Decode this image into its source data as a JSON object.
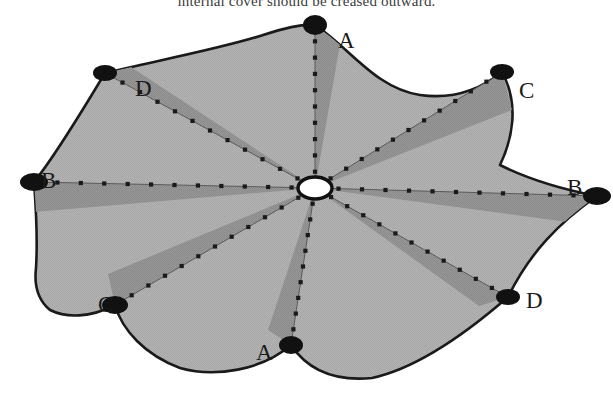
{
  "figure": {
    "title_text": "internal cover should be creased outward.",
    "footer_text": "",
    "type": "origami-crease-pattern",
    "colors": {
      "paper_fill": "#b2b2b2",
      "wedge_fill": "#949494",
      "outline": "#1a1a1a",
      "vertex_dot": "#111111",
      "hub_fill": "#ffffff",
      "crease_dot": "#1a1a1a",
      "crease_line": "#5a5a5a",
      "background": "#ffffff"
    },
    "hub": {
      "name": "center-hub",
      "cx": 315,
      "cy": 188,
      "rx": 17,
      "ry": 11
    },
    "vertices": [
      {
        "label": "A",
        "x": 315,
        "y": 25,
        "label_x": 338,
        "label_y": 32,
        "dot_rx": 12,
        "dot_ry": 10,
        "name": "vertex-a-top"
      },
      {
        "label": "C",
        "x": 502,
        "y": 72,
        "label_x": 519,
        "label_y": 82,
        "dot_rx": 12,
        "dot_ry": 8,
        "name": "vertex-c-top-right"
      },
      {
        "label": "B",
        "x": 597,
        "y": 196,
        "label_x": 567,
        "label_y": 179,
        "dot_rx": 14,
        "dot_ry": 9,
        "name": "vertex-b-right"
      },
      {
        "label": "D",
        "x": 508,
        "y": 297,
        "label_x": 526,
        "label_y": 292,
        "dot_rx": 12,
        "dot_ry": 8,
        "name": "vertex-d-bottom-right"
      },
      {
        "label": "A",
        "x": 291,
        "y": 345,
        "label_x": 256,
        "label_y": 344,
        "dot_rx": 12,
        "dot_ry": 9,
        "name": "vertex-a-bottom"
      },
      {
        "label": "C",
        "x": 115,
        "y": 305,
        "label_x": 98,
        "label_y": 296,
        "dot_rx": 13,
        "dot_ry": 9,
        "name": "vertex-c-bottom-left"
      },
      {
        "label": "B",
        "x": 34,
        "y": 182,
        "label_x": 41,
        "label_y": 172,
        "dot_rx": 14,
        "dot_ry": 9,
        "name": "vertex-b-left"
      },
      {
        "label": "D",
        "x": 105,
        "y": 73,
        "label_x": 135,
        "label_y": 80,
        "dot_rx": 12,
        "dot_ry": 8,
        "name": "vertex-d-top-left"
      }
    ],
    "outline_path": "M 315 25 C 350 48 375 88 420 95 C 455 100 482 88 502 72 C 520 105 512 140 500 165 C 530 180 566 190 597 196 C 560 222 530 252 508 297 C 470 330 418 368 372 378 C 330 382 305 366 291 345 C 262 370 215 378 180 368 C 145 355 122 330 115 305 C 90 318 66 318 50 310 C 38 300 34 285 36 268 C 38 235 36 208 34 182 C 52 160 78 118 105 73 C 150 62 215 50 260 36 C 285 28 300 24 315 25 Z",
    "wedges": [
      {
        "name": "wedge-a-top",
        "path": "M 315 188 L 315 25 L 340 44 Z"
      },
      {
        "name": "wedge-c-top-right",
        "path": "M 315 188 L 502 72 L 512 110 Z"
      },
      {
        "name": "wedge-b-right",
        "path": "M 315 188 L 597 196 L 597 226 Z"
      },
      {
        "name": "wedge-d-bottom-right",
        "path": "M 315 188 L 508 297 L 479 306 Z"
      },
      {
        "name": "wedge-a-bottom",
        "path": "M 315 188 L 291 345 L 268 330 Z"
      },
      {
        "name": "wedge-c-bottom-left",
        "path": "M 315 188 L 115 305 L 108 274 Z"
      },
      {
        "name": "wedge-b-left",
        "path": "M 315 188 L 34 182 L 34 212 Z"
      },
      {
        "name": "wedge-d-top-left",
        "path": "M 315 188 L 105 73 L 131 67 Z"
      }
    ],
    "creases": [
      {
        "name": "crease-to-a-top",
        "x2": 315,
        "y2": 25,
        "dots": 9
      },
      {
        "name": "crease-to-c-top-right",
        "x2": 502,
        "y2": 72,
        "dots": 11
      },
      {
        "name": "crease-to-b-right",
        "x2": 597,
        "y2": 196,
        "dots": 11
      },
      {
        "name": "crease-to-d-bottom-right",
        "x2": 508,
        "y2": 297,
        "dots": 11
      },
      {
        "name": "crease-to-a-bottom",
        "x2": 291,
        "y2": 345,
        "dots": 9
      },
      {
        "name": "crease-to-c-bottom-left",
        "x2": 115,
        "y2": 305,
        "dots": 11
      },
      {
        "name": "crease-to-b-left",
        "x2": 34,
        "y2": 182,
        "dots": 11
      },
      {
        "name": "crease-to-d-top-left",
        "x2": 105,
        "y2": 73,
        "dots": 11
      }
    ]
  }
}
